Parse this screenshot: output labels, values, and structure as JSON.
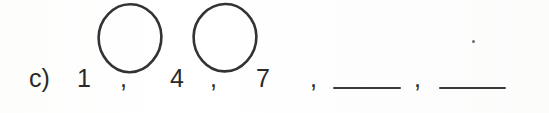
{
  "worksheet": {
    "item_label": "c)",
    "sequence": {
      "terms": [
        "1",
        "4",
        "7"
      ],
      "separator": ",",
      "blanks": 2,
      "blank_placeholder": ""
    },
    "separators": {
      "comma_1": ",",
      "comma_2": ",",
      "comma_3": ",",
      "comma_4": ","
    },
    "annotations": {
      "circles": [
        {
          "name": "circle-between-1-and-4",
          "note": ""
        },
        {
          "name": "circle-between-4-and-7",
          "note": ""
        }
      ],
      "speck": ""
    }
  },
  "colors": {
    "ink": "#2a2a2a",
    "rule": "#3a3a3a",
    "paper": "#fefefe",
    "pencil": "#333333"
  }
}
